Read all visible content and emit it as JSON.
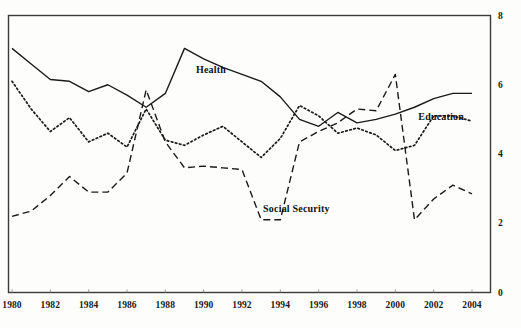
{
  "chart_data": {
    "type": "line",
    "title": "",
    "subtitle": "",
    "xlabel": "",
    "ylabel": "",
    "xlim": [
      1980,
      2004
    ],
    "ylim": [
      0,
      8
    ],
    "grid": false,
    "legend_position": "inline-annotations",
    "x_tick_labels": [
      "1980",
      "1982",
      "1984",
      "1986",
      "1988",
      "1990",
      "1992",
      "1994",
      "1996",
      "1998",
      "2000",
      "2002",
      "2004"
    ],
    "x_tick_values": [
      1980,
      1982,
      1984,
      1986,
      1988,
      1990,
      1992,
      1994,
      1996,
      1998,
      2000,
      2002,
      2004
    ],
    "y_tick_labels": [
      "0",
      "2",
      "4",
      "6",
      "8"
    ],
    "y_tick_values": [
      0,
      2,
      4,
      6,
      8
    ],
    "x": [
      1980,
      1981,
      1982,
      1983,
      1984,
      1985,
      1986,
      1987,
      1988,
      1989,
      1990,
      1991,
      1992,
      1993,
      1994,
      1995,
      1996,
      1997,
      1998,
      1999,
      2000,
      2001,
      2002,
      2003,
      2004
    ],
    "series": [
      {
        "name": "Health",
        "style": "solid",
        "color": "#1a1a1a",
        "values": [
          7.05,
          6.6,
          6.15,
          6.1,
          5.8,
          6.0,
          5.7,
          5.35,
          5.75,
          7.05,
          6.75,
          6.5,
          6.3,
          6.1,
          5.65,
          5.0,
          4.8,
          5.2,
          4.9,
          5.0,
          5.15,
          5.35,
          5.6,
          5.75,
          5.75
        ]
      },
      {
        "name": "Social Security",
        "style": "dashed",
        "color": "#1a1a1a",
        "values": [
          2.2,
          2.35,
          2.8,
          3.35,
          2.9,
          2.9,
          3.45,
          5.85,
          4.35,
          3.6,
          3.65,
          3.6,
          3.55,
          2.1,
          2.1,
          4.35,
          4.65,
          4.9,
          5.3,
          5.25,
          6.3,
          2.1,
          2.7,
          3.1,
          2.85
        ]
      },
      {
        "name": "Education",
        "style": "dotted",
        "color": "#1a1a1a",
        "values": [
          6.1,
          5.3,
          4.65,
          5.05,
          4.35,
          4.6,
          4.2,
          5.3,
          4.4,
          4.25,
          4.55,
          4.8,
          4.35,
          3.9,
          4.45,
          5.4,
          5.1,
          4.6,
          4.75,
          4.55,
          4.1,
          4.25,
          5.1,
          5.1,
          4.95
        ]
      }
    ],
    "annotations": [
      {
        "text": "Health",
        "x": 1989.6,
        "y": 6.45
      },
      {
        "text": "Social Security",
        "x": 1993.1,
        "y": 2.45
      },
      {
        "text": "Education",
        "x": 2001.2,
        "y": 5.1
      }
    ]
  }
}
